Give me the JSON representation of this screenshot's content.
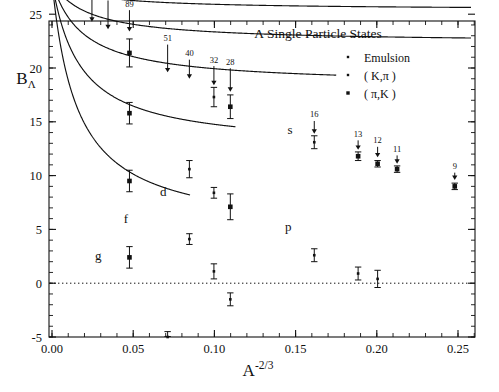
{
  "chart_data": {
    "type": "scatter",
    "title": "Λ Single Particle States",
    "xlabel": "A",
    "xlabel_exponent": "-2/3",
    "ylabel": "B",
    "ylabel_subscript": "Λ",
    "xlim": [
      -0.004,
      0.26
    ],
    "ylim": [
      -5,
      30
    ],
    "xticks": [
      0.0,
      0.05,
      0.1,
      0.15,
      0.2,
      0.25
    ],
    "xtick_labels": [
      "0.00",
      "0.05",
      "0.10",
      "0.15",
      "0.20",
      "0.25"
    ],
    "yticks": [
      -5,
      0,
      5,
      10,
      15,
      20,
      25,
      30
    ],
    "ytick_labels": [
      "-5",
      "0",
      "5",
      "10",
      "15",
      "20",
      "25",
      "30"
    ],
    "xminor_step": 0.01,
    "yminor_step": 1,
    "grid": false,
    "zero_line": {
      "y": 0,
      "style": "dotted"
    },
    "legend": {
      "position": "top-right",
      "entries": [
        {
          "label": "Emulsion",
          "marker": "small-square"
        },
        {
          "label": "( K,π )",
          "marker": "small-square"
        },
        {
          "label": "( π,K )",
          "marker": "filled-square"
        }
      ]
    },
    "curve_labels": [
      {
        "text": "s",
        "x": 0.1465,
        "y": 13.9
      },
      {
        "text": "p",
        "x": 0.1455,
        "y": 4.85
      },
      {
        "text": "d",
        "x": 0.0685,
        "y": 8.1
      },
      {
        "text": "f",
        "x": 0.0455,
        "y": 5.6
      },
      {
        "text": "g",
        "x": 0.0285,
        "y": 2.15
      }
    ],
    "mass_annotations": [
      {
        "label": "208",
        "x": 0.0246,
        "text_y": 28.2,
        "arrow_to_y": 24.3
      },
      {
        "label": "138",
        "x": 0.0345,
        "text_y": 26.6,
        "arrow_to_y": 23.6
      },
      {
        "label": "89",
        "x": 0.0477,
        "text_y": 25.7,
        "arrow_to_y": 23.4
      },
      {
        "label": "51",
        "x": 0.0712,
        "text_y": 22.5,
        "arrow_to_y": 19.6
      },
      {
        "label": "40",
        "x": 0.0846,
        "text_y": 21.1,
        "arrow_to_y": 19.0
      },
      {
        "label": "32",
        "x": 0.0997,
        "text_y": 20.5,
        "arrow_to_y": 18.4
      },
      {
        "label": "28",
        "x": 0.1098,
        "text_y": 20.3,
        "arrow_to_y": 17.8
      },
      {
        "label": "16",
        "x": 0.1615,
        "text_y": 15.4,
        "arrow_to_y": 13.9
      },
      {
        "label": "13",
        "x": 0.1885,
        "text_y": 13.6,
        "arrow_to_y": 12.4
      },
      {
        "label": "12",
        "x": 0.2005,
        "text_y": 13.0,
        "arrow_to_y": 11.7
      },
      {
        "label": "11",
        "x": 0.2125,
        "text_y": 12.2,
        "arrow_to_y": 11.1
      },
      {
        "label": "9",
        "x": 0.248,
        "text_y": 10.6,
        "arrow_to_y": 9.6
      }
    ],
    "series": [
      {
        "name": "s",
        "shell": "s",
        "curve": {
          "B0": 28.0,
          "c": 104.0,
          "d": 40.0,
          "x_start": 0.0,
          "x_end": 0.258
        },
        "points": [
          {
            "x": 0.0477,
            "y": 21.4,
            "err": 1.3,
            "marker": "filled-square"
          },
          {
            "x": 0.0997,
            "y": 17.3,
            "err": 0.9,
            "marker": "small-square"
          },
          {
            "x": 0.1098,
            "y": 16.4,
            "err": 1.1,
            "marker": "filled-square"
          },
          {
            "x": 0.1615,
            "y": 13.1,
            "err": 0.6,
            "marker": "small-square"
          },
          {
            "x": 0.1885,
            "y": 11.8,
            "err": 0.4,
            "marker": "filled-square"
          },
          {
            "x": 0.2005,
            "y": 11.1,
            "err": 0.3,
            "marker": "filled-square"
          },
          {
            "x": 0.2125,
            "y": 10.6,
            "err": 0.3,
            "marker": "filled-square"
          },
          {
            "x": 0.248,
            "y": 9.0,
            "err": 0.3,
            "marker": "filled-square"
          }
        ]
      },
      {
        "name": "p",
        "shell": "p",
        "curve": {
          "B0": 28.0,
          "c": 260.0,
          "d": 46.0,
          "x_start": 0.0,
          "x_end": 0.258
        },
        "points": [
          {
            "x": 0.0477,
            "y": 15.8,
            "err": 1.0,
            "marker": "filled-square"
          },
          {
            "x": 0.0846,
            "y": 10.6,
            "err": 0.8,
            "marker": "small-square"
          },
          {
            "x": 0.0997,
            "y": 8.4,
            "err": 0.5,
            "marker": "small-square"
          },
          {
            "x": 0.1098,
            "y": 7.1,
            "err": 1.2,
            "marker": "filled-square"
          },
          {
            "x": 0.1615,
            "y": 2.6,
            "err": 0.6,
            "marker": "small-square"
          },
          {
            "x": 0.1885,
            "y": 0.9,
            "err": 0.6,
            "marker": "small-square"
          },
          {
            "x": 0.2005,
            "y": 0.4,
            "err": 0.8,
            "marker": "small-square"
          }
        ]
      },
      {
        "name": "d",
        "shell": "d",
        "curve": {
          "B0": 28.0,
          "c": 500.0,
          "d": 52.0,
          "x_start": 0.0,
          "x_end": 0.175
        },
        "points": [
          {
            "x": 0.0477,
            "y": 9.5,
            "err": 1.0,
            "marker": "filled-square"
          },
          {
            "x": 0.0846,
            "y": 4.1,
            "err": 0.5,
            "marker": "small-square"
          },
          {
            "x": 0.0997,
            "y": 1.1,
            "err": 0.7,
            "marker": "small-square"
          },
          {
            "x": 0.1098,
            "y": -1.5,
            "err": 0.6,
            "marker": "small-square"
          }
        ]
      },
      {
        "name": "f",
        "shell": "f",
        "curve": {
          "B0": 28.0,
          "c": 900.0,
          "d": 58.0,
          "x_start": 0.0,
          "x_end": 0.113
        },
        "points": [
          {
            "x": 0.0477,
            "y": 2.4,
            "err": 1.0,
            "marker": "filled-square"
          },
          {
            "x": 0.0712,
            "y": -5.0,
            "err": 0.5,
            "marker": "small-square"
          }
        ]
      },
      {
        "name": "g",
        "shell": "g",
        "curve": {
          "B0": 28.0,
          "c": 1500.0,
          "d": 64.0,
          "x_start": 0.0,
          "x_end": 0.085
        },
        "points": []
      }
    ]
  }
}
